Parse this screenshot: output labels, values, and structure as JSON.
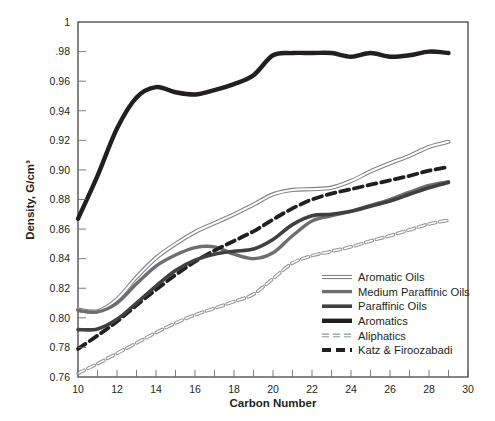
{
  "chart_data": {
    "type": "line",
    "title": "",
    "xlabel": "Carbon Number",
    "ylabel": "Density, G/cm³",
    "xlim": [
      10,
      30
    ],
    "ylim": [
      0.76,
      1.0
    ],
    "xticks": [
      10,
      12,
      14,
      16,
      18,
      20,
      22,
      24,
      26,
      28,
      30
    ],
    "xtick_labels": [
      "10",
      "12",
      "14",
      "16",
      "18",
      "20",
      "22",
      "24",
      "26",
      "28",
      "30"
    ],
    "x_minor_tick_step": 1,
    "yticks": [
      0.76,
      0.78,
      0.8,
      0.82,
      0.84,
      0.86,
      0.88,
      0.9,
      0.92,
      0.94,
      0.96,
      0.98,
      1.0
    ],
    "ytick_labels": [
      "0.76",
      "0.78",
      "0.80",
      "0.82",
      "0.84",
      "0.86",
      "0.88",
      "0.90",
      "0.92",
      "0.94",
      "0.96",
      ".98",
      "1"
    ],
    "grid": false,
    "legend_position": "lower-right-inside",
    "x": [
      10,
      11,
      12,
      13,
      14,
      15,
      16,
      17,
      18,
      19,
      20,
      21,
      22,
      23,
      24,
      25,
      26,
      27,
      28,
      29
    ],
    "series": [
      {
        "name": "Aromatic Oils",
        "style": "outlined-thin",
        "color": "#808285",
        "values": [
          0.8055,
          0.8045,
          0.8125,
          0.8275,
          0.8405,
          0.85,
          0.858,
          0.864,
          0.87,
          0.8765,
          0.8835,
          0.8865,
          0.887,
          0.888,
          0.8925,
          0.899,
          0.9045,
          0.9095,
          0.9155,
          0.919
        ]
      },
      {
        "name": "Medium Paraffinic Oils",
        "style": "solid-medium",
        "color": "#6d6e71",
        "values": [
          0.805,
          0.804,
          0.81,
          0.823,
          0.835,
          0.8425,
          0.8475,
          0.848,
          0.843,
          0.84,
          0.844,
          0.8555,
          0.8655,
          0.869,
          0.872,
          0.876,
          0.88,
          0.885,
          0.8895,
          0.892
        ]
      },
      {
        "name": "Paraffinic Oils",
        "style": "solid-heavy",
        "color": "#404041",
        "values": [
          0.792,
          0.7925,
          0.799,
          0.81,
          0.8215,
          0.832,
          0.839,
          0.843,
          0.845,
          0.8465,
          0.853,
          0.863,
          0.869,
          0.87,
          0.872,
          0.8755,
          0.879,
          0.8835,
          0.888,
          0.8915
        ]
      },
      {
        "name": "Aromatics",
        "style": "solid-thick-black",
        "color": "#231f20",
        "values": [
          0.867,
          0.896,
          0.928,
          0.949,
          0.956,
          0.9525,
          0.951,
          0.954,
          0.958,
          0.964,
          0.9775,
          0.979,
          0.979,
          0.979,
          0.9765,
          0.979,
          0.9765,
          0.9775,
          0.98,
          0.979
        ]
      },
      {
        "name": "Aliphatics",
        "style": "dashed-thin",
        "color": "#939598",
        "values": [
          0.7625,
          0.769,
          0.776,
          0.783,
          0.79,
          0.7965,
          0.802,
          0.8065,
          0.811,
          0.816,
          0.8265,
          0.837,
          0.842,
          0.845,
          0.848,
          0.852,
          0.8555,
          0.8595,
          0.8635,
          0.866
        ]
      },
      {
        "name": "Katz & Firoozabadi",
        "style": "dashed-heavy",
        "color": "#231f20",
        "values": [
          0.779,
          0.788,
          0.7975,
          0.8085,
          0.819,
          0.829,
          0.838,
          0.8455,
          0.852,
          0.8585,
          0.8665,
          0.874,
          0.88,
          0.884,
          0.887,
          0.89,
          0.893,
          0.896,
          0.8995,
          0.902
        ]
      }
    ],
    "legend": [
      {
        "label": "Aromatic Oils",
        "swatch": "outlined-thin"
      },
      {
        "label": "Medium Paraffinic Oils",
        "swatch": "solid-medium"
      },
      {
        "label": "Paraffinic Oils",
        "swatch": "solid-heavy"
      },
      {
        "label": "Aromatics",
        "swatch": "solid-thick-black"
      },
      {
        "label": "Aliphatics",
        "swatch": "dashed-thin"
      },
      {
        "label": "Katz & Firoozabadi",
        "swatch": "dashed-heavy"
      }
    ]
  }
}
